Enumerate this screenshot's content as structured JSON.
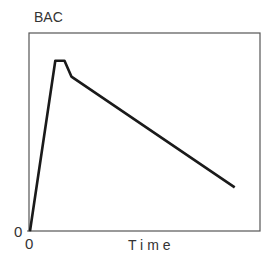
{
  "chart_data": {
    "type": "line",
    "title": "",
    "xlabel": "Time",
    "ylabel": "BAC",
    "x_origin_label": "0",
    "y_origin_label": "0",
    "grid": false,
    "legend": null,
    "xlim": [
      0,
      100
    ],
    "ylim": [
      0,
      100
    ],
    "series": [
      {
        "name": "BAC",
        "x": [
          0,
          11,
          15,
          18,
          89
        ],
        "y": [
          0,
          86,
          86,
          78,
          22
        ]
      }
    ],
    "annotations": []
  }
}
